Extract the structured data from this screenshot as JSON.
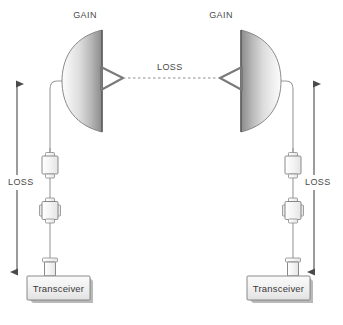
{
  "diagram": {
    "background_color": "#ffffff",
    "stroke_color": "#6b6b6b",
    "text_color": "#4a4a4a",
    "dish_light": "#fdfdfd",
    "dish_dark": "#8e8e8e",
    "body_fill": "#f2f2f2",
    "shadow_color": "#b9b9b9"
  },
  "antennas": [
    {
      "id": "left-antenna",
      "label": "GAIN",
      "faces": "right",
      "label_x": 77,
      "label_y": 10
    },
    {
      "id": "right-antenna",
      "label": "GAIN",
      "faces": "left",
      "label_x": 213,
      "label_y": 10
    }
  ],
  "path_loss": {
    "label": "LOSS",
    "label_x": 155,
    "label_y": 62,
    "line_style": "dashed"
  },
  "cable_loss": [
    {
      "id": "left-cable-loss",
      "label": "LOSS",
      "label_x": 9,
      "label_y": 182,
      "arrow": "double-headed-vertical"
    },
    {
      "id": "right-cable-loss",
      "label": "LOSS",
      "label_x": 305,
      "label_y": 182,
      "arrow": "double-headed-vertical"
    }
  ],
  "transceivers": [
    {
      "id": "left-transceiver",
      "label": "Transceiver",
      "label_x": 36,
      "label_y": 287
    },
    {
      "id": "right-transceiver",
      "label": "Transceiver",
      "label_x": 256,
      "label_y": 287
    }
  ],
  "inline_components": [
    {
      "id": "left-connector-upper",
      "type": "coax-connector"
    },
    {
      "id": "left-connector-lower",
      "type": "flanged-block"
    },
    {
      "id": "left-connector-base",
      "type": "panel-connector"
    },
    {
      "id": "right-connector-upper",
      "type": "coax-connector"
    },
    {
      "id": "right-connector-lower",
      "type": "flanged-block"
    },
    {
      "id": "right-connector-base",
      "type": "panel-connector"
    }
  ]
}
